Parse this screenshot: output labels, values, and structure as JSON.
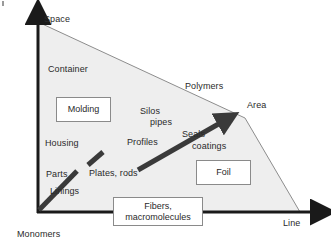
{
  "figure": {
    "type": "triangle-positioning-diagram",
    "axes": {
      "y_label": "Space",
      "x_label": "Line",
      "origin_label": "Monomers",
      "apex_label": "Area"
    },
    "region_label": "Polymers",
    "colors": {
      "triangle_fill": "#eeeeee",
      "triangle_stroke": "#8d8d8d",
      "axis": "#1a1a1a",
      "arrow": "#3a3a3a",
      "text": "#2a2a2a",
      "box_border": "#8a8a8a",
      "background": "#ffffff"
    },
    "labels": [
      {
        "id": "container",
        "text": "Container"
      },
      {
        "id": "polymers",
        "text": "Polymers"
      },
      {
        "id": "silos-pipes-line1",
        "text": "Silos"
      },
      {
        "id": "silos-pipes-line2",
        "text": "pipes"
      },
      {
        "id": "housing",
        "text": "Housing"
      },
      {
        "id": "profiles",
        "text": "Profiles"
      },
      {
        "id": "seals",
        "text": "Seals"
      },
      {
        "id": "coatings",
        "text": "coatings"
      },
      {
        "id": "parts",
        "text": "Parts"
      },
      {
        "id": "plates-rods",
        "text": "Plates, rods"
      },
      {
        "id": "linings",
        "text": "Linings"
      },
      {
        "id": "area",
        "text": "Area"
      }
    ],
    "boxes": [
      {
        "id": "molding",
        "text": "Molding"
      },
      {
        "id": "foil",
        "text": "Foil"
      },
      {
        "id": "fibers",
        "text": "Fibers,\nmacromolecules"
      }
    ],
    "boxes_text": {
      "molding": "Molding",
      "foil": "Foil",
      "fibers_line1": "Fibers,",
      "fibers_line2": "macromolecules"
    }
  }
}
